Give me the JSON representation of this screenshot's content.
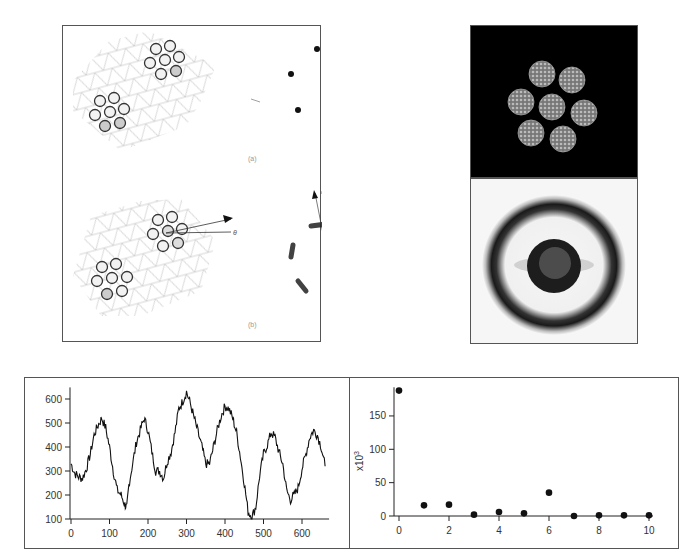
{
  "figure_top_left": {
    "panels": [
      {
        "label": "(a)",
        "theta_label": ""
      },
      {
        "label": "(b)",
        "theta_label": "θ",
        "psi_label": "ψ"
      }
    ],
    "spots_a": [
      [
        316,
        48
      ],
      [
        351,
        58
      ],
      [
        290,
        73
      ],
      [
        361,
        95
      ],
      [
        297,
        109
      ],
      [
        333,
        120
      ]
    ]
  },
  "figure_top_right": {
    "top_image": "TEM image of seven-particle hexagonal cluster",
    "bottom_image": "Diffraction pattern with ring and central disk"
  },
  "chart_data": [
    {
      "type": "line",
      "title": "",
      "xlabel": "",
      "ylabel": "",
      "xlim": [
        0,
        660
      ],
      "ylim": [
        100,
        640
      ],
      "x_ticks": [
        0,
        100,
        200,
        300,
        400,
        500,
        600
      ],
      "y_ticks": [
        100,
        200,
        300,
        400,
        500,
        600
      ],
      "grid": false,
      "series": [
        {
          "name": "signal",
          "x": [
            0,
            10,
            20,
            30,
            40,
            50,
            60,
            70,
            80,
            90,
            100,
            110,
            120,
            130,
            140,
            145,
            150,
            160,
            170,
            180,
            190,
            200,
            210,
            220,
            230,
            240,
            250,
            260,
            270,
            280,
            290,
            300,
            310,
            320,
            330,
            340,
            350,
            360,
            370,
            380,
            390,
            400,
            410,
            420,
            430,
            440,
            450,
            460,
            470,
            480,
            490,
            500,
            510,
            520,
            530,
            540,
            550,
            560,
            570,
            580,
            590,
            600,
            610,
            620,
            630,
            640,
            650,
            660
          ],
          "values": [
            330,
            290,
            275,
            270,
            310,
            370,
            450,
            490,
            520,
            480,
            400,
            300,
            220,
            200,
            160,
            145,
            240,
            330,
            420,
            470,
            520,
            470,
            380,
            300,
            300,
            270,
            340,
            380,
            460,
            560,
            590,
            630,
            580,
            520,
            460,
            400,
            330,
            330,
            400,
            470,
            530,
            570,
            560,
            520,
            460,
            360,
            250,
            130,
            110,
            150,
            280,
            370,
            410,
            460,
            440,
            380,
            330,
            220,
            180,
            200,
            230,
            310,
            370,
            440,
            470,
            450,
            400,
            320
          ]
        }
      ]
    },
    {
      "type": "scatter",
      "title": "",
      "xlabel": "",
      "ylabel": "x10³",
      "xlim": [
        0,
        10
      ],
      "ylim": [
        0,
        190
      ],
      "x_ticks": [
        0,
        2,
        4,
        6,
        8,
        10
      ],
      "y_ticks": [
        0,
        50,
        100,
        150
      ],
      "grid": false,
      "series": [
        {
          "name": "points",
          "x": [
            0,
            1,
            2,
            3,
            4,
            5,
            6,
            7,
            8,
            9,
            10
          ],
          "values": [
            188,
            16,
            17,
            2,
            6,
            4,
            35,
            0,
            1,
            1,
            1
          ]
        }
      ]
    }
  ],
  "axes": {
    "left": {
      "y_tick_labels": [
        "100",
        "200",
        "300",
        "400",
        "500",
        "600"
      ],
      "x_tick_labels": [
        "0",
        "100",
        "200",
        "300",
        "400",
        "500",
        "600"
      ]
    },
    "right": {
      "y_tick_labels": [
        "0",
        "50",
        "100",
        "150"
      ],
      "x_tick_labels": [
        "0",
        "2",
        "4",
        "6",
        "8",
        "10"
      ],
      "ylabel": "x10",
      "ylabel_exp": "3"
    }
  }
}
